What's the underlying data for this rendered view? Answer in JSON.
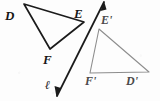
{
  "figure": {
    "kind": "geometry-reflection-diagram",
    "background_color": "#fdfdfd",
    "width": 160,
    "height": 101,
    "preimage": {
      "name": "triangle-def",
      "stroke_color": "#1b1b1b",
      "stroke_width": 1.6,
      "vertices": [
        {
          "id": "D",
          "label": "D",
          "x": 24,
          "y": 4,
          "label_x": 5,
          "label_y": 9
        },
        {
          "id": "E",
          "label": "E",
          "x": 84,
          "y": 22,
          "label_x": 74,
          "label_y": 7
        },
        {
          "id": "F",
          "label": "F",
          "x": 50,
          "y": 49,
          "label_x": 43,
          "label_y": 53
        }
      ]
    },
    "image": {
      "name": "triangle-d-prime-e-prime-f-prime",
      "stroke_color": "#8d8d8d",
      "stroke_width": 1.1,
      "vertices": [
        {
          "id": "E_prime",
          "label": "E'",
          "x": 99,
          "y": 29,
          "label_x": 101,
          "label_y": 14
        },
        {
          "id": "F_prime",
          "label": "F'",
          "x": 90,
          "y": 73,
          "label_x": 85,
          "label_y": 75
        },
        {
          "id": "D_prime",
          "label": "D'",
          "x": 149,
          "y": 72,
          "label_x": 126,
          "label_y": 75
        }
      ]
    },
    "line_of_reflection": {
      "name": "line-l",
      "label": "ℓ",
      "label_x": 45,
      "label_y": 79,
      "stroke_color": "#1b1b1b",
      "stroke_width": 1.6,
      "from": {
        "x": 57,
        "y": 96
      },
      "to": {
        "x": 104,
        "y": 2
      },
      "arrowheads": "both"
    }
  }
}
